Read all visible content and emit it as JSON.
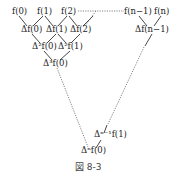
{
  "figure": {
    "caption": "図 8-3"
  },
  "rows": {
    "row0": [
      "f(0)",
      "f(1)",
      "f(2)",
      "f(n−1)",
      "f(n)"
    ],
    "row1": [
      "Δf(0)",
      "Δf(1)",
      "Δf(2)",
      "Δf(n−1)"
    ],
    "row2": [
      "Δ²f(0)",
      "Δ²f(1)"
    ],
    "row3": [
      "Δ³f(0)"
    ],
    "near_bottom": [
      "Δⁿ⁻¹f(1)"
    ],
    "bottom": [
      "Δⁿf(0)"
    ]
  },
  "colors": {
    "text": "#222222",
    "line": "#333333",
    "dotted": "#666666"
  }
}
